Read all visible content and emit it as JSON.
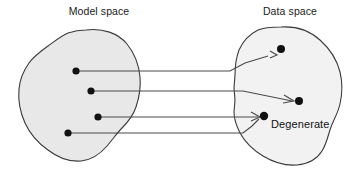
{
  "figure": {
    "type": "diagram",
    "kind": "set-mapping-diagram",
    "background_color": "#ffffff",
    "stroke_color": "#3a3a3a",
    "blob_fill_color": "#e8e8e8",
    "dot_color": "#111111",
    "titles": {
      "left": "Model space",
      "right": "Data space"
    },
    "annotations": {
      "degenerate": "Degenerate"
    },
    "regions": [
      {
        "id": "model-space",
        "label": "Model space",
        "fill": "#e8e8e8",
        "label_x": 99,
        "label_y": 14
      },
      {
        "id": "data-space",
        "label": "Data space",
        "fill": "#f2f2f2",
        "label_x": 290,
        "label_y": 14
      }
    ],
    "model_points": [
      {
        "id": "m1",
        "x": 76,
        "y": 71
      },
      {
        "id": "m2",
        "x": 91,
        "y": 91
      },
      {
        "id": "m3",
        "x": 98,
        "y": 117
      },
      {
        "id": "m4",
        "x": 68,
        "y": 133
      }
    ],
    "data_points": [
      {
        "id": "d1",
        "x": 281,
        "y": 49
      },
      {
        "id": "d2",
        "x": 299,
        "y": 101
      },
      {
        "id": "d3",
        "x": 264,
        "y": 116,
        "label": "Degenerate"
      }
    ],
    "mappings": [
      {
        "from": "m1",
        "to": "d1",
        "arrow": true
      },
      {
        "from": "m2",
        "to": "d2",
        "arrow": true
      },
      {
        "from": "m3",
        "to": "d3",
        "arrow": true
      },
      {
        "from": "m4",
        "to": "d3",
        "arrow": true
      }
    ],
    "degenerate_note": "Two distinct model points map to the same data point"
  }
}
